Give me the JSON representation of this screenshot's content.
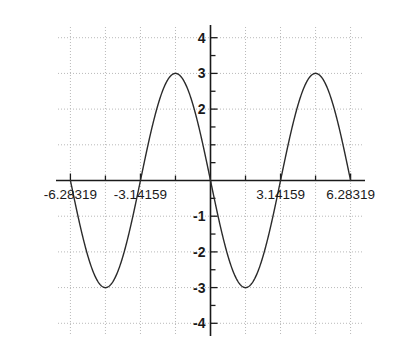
{
  "chart_data": {
    "type": "line",
    "title": "",
    "subtitle": "",
    "xlabel": "",
    "ylabel": "",
    "xlim": [
      -6.84,
      6.84
    ],
    "ylim": [
      -4.3,
      4.3
    ],
    "grid": true,
    "legend_position": "none",
    "function": "y = -3*sin(x)",
    "line_color": "#2b2b2b",
    "grid_color": "#b9b9b9",
    "axis_color": "#1a1a1a",
    "background_color": "#ffffff",
    "xticks": [
      -6.28319,
      -3.14159,
      3.14159,
      6.28319
    ],
    "xtick_labels": [
      "-6.28319",
      "-3.14159",
      "3.14159",
      "6.28319"
    ],
    "xticks_minor": [
      -4.712389,
      -1.570796,
      0,
      1.570796,
      4.712389
    ],
    "yticks": [
      4,
      3,
      2,
      -1,
      -2,
      -3,
      -4
    ],
    "ytick_labels": [
      "4",
      "3",
      "2",
      "-1",
      "-2",
      "-3",
      "-4"
    ],
    "yticks_minor": [
      3.5,
      2.5,
      1.5,
      1,
      0.5,
      -0.5,
      -1.5,
      -2.5,
      -3.5
    ],
    "gridlines_x": [
      -6.28319,
      -4.712389,
      -3.14159,
      -1.570796,
      0,
      1.570796,
      3.14159,
      4.712389,
      6.28319
    ],
    "gridlines_y": [
      4,
      3,
      2,
      1,
      0,
      -1,
      -2,
      -3,
      -4
    ],
    "series": [
      {
        "name": "-3 sin(x)",
        "x": [
          -6.28319,
          -6.0,
          -5.75,
          -5.5,
          -5.25,
          -5.0,
          -4.75,
          -4.712389,
          -4.5,
          -4.25,
          -4.0,
          -3.75,
          -3.5,
          -3.25,
          -3.14159,
          -3.0,
          -2.75,
          -2.5,
          -2.25,
          -2.0,
          -1.75,
          -1.570796,
          -1.5,
          -1.25,
          -1.0,
          -0.75,
          -0.5,
          -0.25,
          0,
          0.25,
          0.5,
          0.75,
          1.0,
          1.25,
          1.5,
          1.570796,
          1.75,
          2.0,
          2.25,
          2.5,
          2.75,
          3.0,
          3.14159,
          3.25,
          3.5,
          3.75,
          4.0,
          4.25,
          4.5,
          4.712389,
          4.75,
          5.0,
          5.25,
          5.5,
          5.75,
          6.0,
          6.28319
        ],
        "y": [
          0.0,
          -0.84,
          -1.44,
          -2.12,
          -2.61,
          -2.88,
          -2.99,
          -3.0,
          -2.93,
          -2.68,
          -2.27,
          -1.72,
          -1.05,
          -0.33,
          0.0,
          0.42,
          1.14,
          1.8,
          2.34,
          2.73,
          2.95,
          3.0,
          2.99,
          2.85,
          2.52,
          2.04,
          1.44,
          0.74,
          0.0,
          -0.74,
          -1.44,
          -2.04,
          -2.52,
          -2.85,
          -2.99,
          -3.0,
          -2.95,
          -2.73,
          -2.34,
          -1.8,
          -1.14,
          -0.42,
          0.0,
          0.33,
          1.05,
          1.72,
          2.27,
          2.68,
          2.93,
          3.0,
          2.99,
          2.88,
          2.61,
          2.12,
          1.44,
          0.84,
          0.0
        ]
      }
    ],
    "annotations": [],
    "key_points": {
      "maxima": [
        {
          "x": -1.570796,
          "y": 3
        },
        {
          "x": 4.712389,
          "y": 3
        }
      ],
      "minima": [
        {
          "x": -4.712389,
          "y": -3
        },
        {
          "x": 1.570796,
          "y": -3
        }
      ],
      "zero_crossings": [
        -6.28319,
        -3.14159,
        0,
        3.14159,
        6.28319
      ],
      "amplitude": 3,
      "period": 6.28319
    }
  }
}
